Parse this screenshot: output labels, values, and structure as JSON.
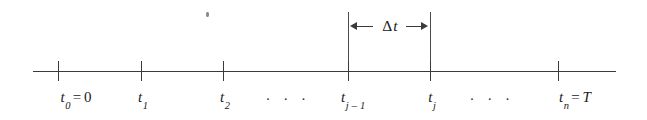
{
  "figure": {
    "background_color": "#ffffff",
    "line_color": "#3a3a3a"
  },
  "axis": {
    "name": "time-axis",
    "start_x": 33,
    "end_x": 616,
    "y": 71,
    "tick_top": 61,
    "tick_bottom": 81,
    "ticks": [
      {
        "id": "t0",
        "x": 58
      },
      {
        "id": "t1",
        "x": 141
      },
      {
        "id": "t2",
        "x": 223
      },
      {
        "id": "tj-1",
        "x": 348
      },
      {
        "id": "tj",
        "x": 430
      },
      {
        "id": "tn",
        "x": 558
      }
    ]
  },
  "tick_labels": [
    {
      "id": "t0",
      "x": 76,
      "y": 90,
      "var": "t",
      "sub": "0",
      "equals": "=",
      "value": "0",
      "full_text": "t0 = 0"
    },
    {
      "id": "t1",
      "x": 143,
      "y": 90,
      "var": "t",
      "sub": "1",
      "equals": "",
      "value": "",
      "full_text": "t1"
    },
    {
      "id": "t2",
      "x": 225,
      "y": 90,
      "var": "t",
      "sub": "2",
      "equals": "",
      "value": "",
      "full_text": "t2"
    },
    {
      "id": "tj-1",
      "x": 353,
      "y": 90,
      "var": "t",
      "sub": "j – 1",
      "equals": "",
      "value": "",
      "full_text": "tj-1"
    },
    {
      "id": "tj",
      "x": 432,
      "y": 90,
      "var": "t",
      "sub": "j",
      "equals": "",
      "value": "",
      "full_text": "tj"
    },
    {
      "id": "tn",
      "x": 575,
      "y": 90,
      "var": "t",
      "sub": "n",
      "equals": "=",
      "value": "T",
      "full_text": "tn = T"
    }
  ],
  "ellipses": [
    {
      "id": "ellipsis-left",
      "x": 288,
      "y": 92,
      "text": "· · ·"
    },
    {
      "id": "ellipsis-right",
      "x": 492,
      "y": 92,
      "text": "· · ·"
    }
  ],
  "delta_bracket": {
    "name": "delta-t-dimension",
    "label": "Δt",
    "label_glyph": "Δ",
    "label_var": "t",
    "label_x": 390,
    "label_y": 26,
    "left_x": 348,
    "right_x": 430,
    "ext_top": 12,
    "ext_bottom": 71,
    "arrow_y": 26
  },
  "artifacts": [
    {
      "id": "scan-speck",
      "x": 206,
      "y": 12,
      "w": 3,
      "h": 5
    }
  ]
}
